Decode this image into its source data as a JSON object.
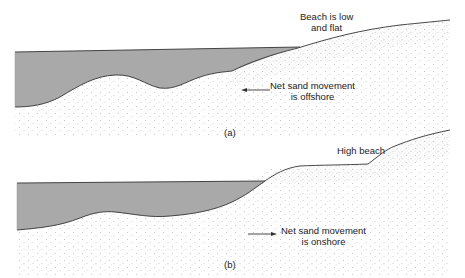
{
  "panels": [
    {
      "id": "a",
      "caption": "(a)",
      "beach_label_line1": "Beach is low",
      "beach_label_line2": "and flat",
      "movement_label_line1": "Net sand movement",
      "movement_label_line2": "is offshore",
      "movement_direction": "offshore"
    },
    {
      "id": "b",
      "caption": "(b)",
      "beach_label_line1": "High beach",
      "movement_label_line1": "Net sand movement",
      "movement_label_line2": "is onshore",
      "movement_direction": "onshore"
    }
  ],
  "colors": {
    "water": "#a9a9a9",
    "line": "#333333",
    "sand_dots": "#8a8a8a"
  }
}
